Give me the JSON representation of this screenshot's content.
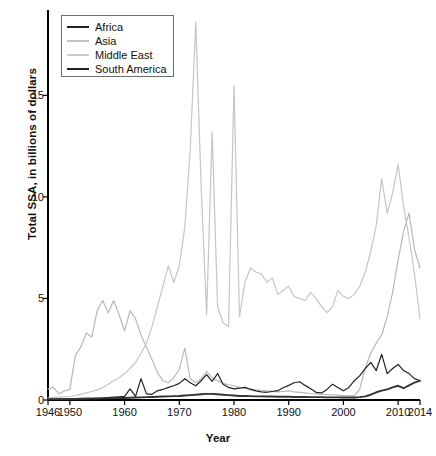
{
  "chart_data": {
    "type": "line",
    "title": "",
    "xlabel": "Year",
    "ylabel": "Total SSA, in billions of dollars",
    "xlim": [
      1946,
      2014
    ],
    "ylim": [
      0,
      19.2
    ],
    "xticks": [
      1946,
      1950,
      1960,
      1970,
      1980,
      1990,
      2000,
      2010,
      2014
    ],
    "yticks": [
      0,
      5,
      10,
      15
    ],
    "grid": false,
    "legend_position": "top-left",
    "x": [
      1946,
      1947,
      1948,
      1949,
      1950,
      1951,
      1952,
      1953,
      1954,
      1955,
      1956,
      1957,
      1958,
      1959,
      1960,
      1961,
      1962,
      1963,
      1964,
      1965,
      1966,
      1967,
      1968,
      1969,
      1970,
      1971,
      1972,
      1973,
      1974,
      1975,
      1976,
      1977,
      1978,
      1979,
      1980,
      1981,
      1982,
      1983,
      1984,
      1985,
      1986,
      1987,
      1988,
      1989,
      1990,
      1991,
      1992,
      1993,
      1994,
      1995,
      1996,
      1997,
      1998,
      1999,
      2000,
      2001,
      2002,
      2003,
      2004,
      2005,
      2006,
      2007,
      2008,
      2009,
      2010,
      2011,
      2012,
      2013,
      2014
    ],
    "series": [
      {
        "name": "Africa",
        "color": "#222222",
        "width": 1.2,
        "values": [
          0.05,
          0.05,
          0.05,
          0.05,
          0.06,
          0.06,
          0.07,
          0.08,
          0.08,
          0.09,
          0.1,
          0.12,
          0.14,
          0.16,
          0.18,
          0.55,
          0.18,
          1.05,
          0.3,
          0.28,
          0.45,
          0.52,
          0.62,
          0.7,
          0.82,
          1.05,
          0.85,
          0.7,
          0.95,
          1.25,
          0.92,
          1.3,
          0.78,
          0.62,
          0.55,
          0.58,
          0.62,
          0.52,
          0.45,
          0.4,
          0.38,
          0.42,
          0.46,
          0.6,
          0.72,
          0.85,
          0.9,
          0.72,
          0.55,
          0.38,
          0.35,
          0.52,
          0.78,
          0.62,
          0.45,
          0.62,
          0.95,
          1.2,
          1.55,
          1.85,
          1.45,
          2.25,
          1.3,
          1.55,
          1.75,
          1.45,
          1.3,
          1.05,
          0.95
        ]
      },
      {
        "name": "Asia",
        "color": "#b8b8b8",
        "width": 1.2,
        "values": [
          0.55,
          0.62,
          0.3,
          0.45,
          0.52,
          2.2,
          2.6,
          3.3,
          3.1,
          4.4,
          4.9,
          4.3,
          4.9,
          4.2,
          3.4,
          4.4,
          4.0,
          3.2,
          2.6,
          2.0,
          1.35,
          0.95,
          0.85,
          1.1,
          1.5,
          2.55,
          1.05,
          0.85,
          1.05,
          1.4,
          1.1,
          0.95,
          0.82,
          0.75,
          0.7,
          0.62,
          0.58,
          0.55,
          0.5,
          0.48,
          0.45,
          0.42,
          0.4,
          0.42,
          0.45,
          0.4,
          0.38,
          0.35,
          0.32,
          0.3,
          0.28,
          0.26,
          0.25,
          0.24,
          0.22,
          0.2,
          0.2,
          0.55,
          1.6,
          2.3,
          2.8,
          3.2,
          4.1,
          5.3,
          6.9,
          8.3,
          9.2,
          7.4,
          6.5
        ]
      },
      {
        "name": "Middle East",
        "color": "#c5c5c5",
        "width": 1.2,
        "values": [
          0.1,
          0.12,
          0.14,
          0.16,
          0.18,
          0.22,
          0.28,
          0.35,
          0.42,
          0.5,
          0.62,
          0.78,
          0.95,
          1.1,
          1.3,
          1.55,
          1.85,
          2.3,
          2.8,
          3.6,
          4.6,
          5.6,
          6.6,
          5.8,
          6.6,
          8.5,
          12.3,
          18.6,
          10.5,
          4.2,
          13.2,
          4.6,
          3.8,
          3.6,
          15.5,
          4.1,
          5.8,
          6.5,
          6.3,
          6.2,
          5.8,
          6.0,
          5.2,
          5.4,
          5.6,
          5.1,
          5.0,
          4.9,
          5.3,
          5.0,
          4.6,
          4.3,
          4.6,
          5.4,
          5.1,
          5.0,
          5.2,
          5.6,
          6.3,
          7.3,
          8.6,
          10.9,
          9.2,
          10.2,
          11.6,
          9.5,
          8.0,
          6.2,
          4.0
        ]
      },
      {
        "name": "South America",
        "color": "#333333",
        "width": 1.9,
        "values": [
          0.04,
          0.04,
          0.04,
          0.05,
          0.05,
          0.05,
          0.06,
          0.06,
          0.07,
          0.07,
          0.08,
          0.08,
          0.09,
          0.1,
          0.1,
          0.11,
          0.12,
          0.13,
          0.14,
          0.15,
          0.16,
          0.17,
          0.18,
          0.19,
          0.2,
          0.22,
          0.24,
          0.26,
          0.28,
          0.3,
          0.3,
          0.28,
          0.26,
          0.24,
          0.22,
          0.2,
          0.2,
          0.19,
          0.18,
          0.18,
          0.17,
          0.17,
          0.16,
          0.16,
          0.16,
          0.15,
          0.15,
          0.15,
          0.14,
          0.14,
          0.14,
          0.13,
          0.13,
          0.13,
          0.12,
          0.12,
          0.12,
          0.14,
          0.18,
          0.26,
          0.38,
          0.46,
          0.52,
          0.62,
          0.7,
          0.58,
          0.72,
          0.86,
          0.95
        ]
      }
    ]
  },
  "legend": {
    "items": [
      {
        "label": "Africa"
      },
      {
        "label": "Asia"
      },
      {
        "label": "Middle East"
      },
      {
        "label": "South America"
      }
    ]
  },
  "axes": {
    "y_title": "Total SSA, in billions of dollars",
    "x_title": "Year"
  }
}
